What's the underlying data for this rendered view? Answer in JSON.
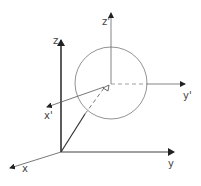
{
  "diagram": {
    "colors": {
      "axis": "#333333",
      "circle": "#777777",
      "label": "#444444"
    },
    "world_axes": {
      "x_label": "x",
      "y_label": "y",
      "z_label": "z"
    },
    "local_axes": {
      "x_label": "x'",
      "y_label": "y'",
      "z_label": "z'"
    },
    "shape": "circle (sphere)"
  }
}
